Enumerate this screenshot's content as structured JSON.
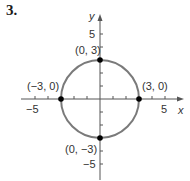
{
  "problem_number": "3.",
  "graph": {
    "x_axis_label": "x",
    "y_axis_label": "y",
    "x_ticks": [
      "−5",
      "5"
    ],
    "y_ticks": [
      "5",
      "−5"
    ],
    "circle": {
      "center": [
        0,
        0
      ],
      "radius": 3,
      "color": "#7a7a7a"
    },
    "points": [
      {
        "label": "(0, 3)",
        "x": 0,
        "y": 3
      },
      {
        "label": "(−3, 0)",
        "x": -3,
        "y": 0
      },
      {
        "label": "(3, 0)",
        "x": 3,
        "y": 0
      },
      {
        "label": "(0, −3)",
        "x": 0,
        "y": -3
      }
    ]
  }
}
